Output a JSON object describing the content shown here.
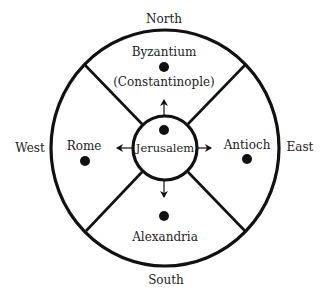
{
  "diagram": {
    "directions": {
      "north": "North",
      "south": "South",
      "east": "East",
      "west": "West"
    },
    "center": {
      "label": "Jerusalem"
    },
    "regions": {
      "north": {
        "label": "Byzantium",
        "sublabel": "(Constantinople)"
      },
      "west": {
        "label": "Rome"
      },
      "east": {
        "label": "Antioch"
      },
      "south": {
        "label": "Alexandria"
      }
    },
    "colors": {
      "stroke": "#111111",
      "text": "#222222",
      "background": "#ffffff"
    }
  }
}
